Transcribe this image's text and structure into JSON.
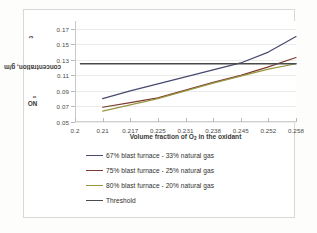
{
  "figure": {
    "background": "#ffffff",
    "border_color": "#d8d8d6"
  },
  "chart_data": {
    "type": "line",
    "title": "",
    "xlabel_text": "Volume fraction of O",
    "xlabel_sub": "2",
    "xlabel_tail": " in the oxidant",
    "ylabel_prefix": "NO",
    "ylabel_sub": "x",
    "ylabel_tail": " concentration, g/m",
    "ylabel_sup": "3",
    "categories": [
      "0.2",
      "0.21",
      "0.217",
      "0.225",
      "0.231",
      "0.238",
      "0.245",
      "0.252",
      "0.258"
    ],
    "x_positions": [
      0,
      1,
      2,
      3,
      4,
      5,
      6,
      7,
      8
    ],
    "yticks": [
      "0.05",
      "0.07",
      "0.09",
      "0.11",
      "0.13",
      "0.15",
      "0.17"
    ],
    "ytick_values": [
      0.05,
      0.07,
      0.09,
      0.11,
      0.13,
      0.15,
      0.17
    ],
    "ylim": [
      0.05,
      0.18
    ],
    "xlim": [
      0,
      8
    ],
    "grid": true,
    "legend_position": "below",
    "series": [
      {
        "name": "67% blast furnace - 33% natural gas",
        "color": "#47496e",
        "x": [
          1,
          2,
          3,
          4,
          5,
          6,
          7,
          8
        ],
        "values": [
          0.08,
          0.09,
          0.099,
          0.108,
          0.117,
          0.126,
          0.14,
          0.16
        ]
      },
      {
        "name": "75% blast furnace - 25% natural gas",
        "color": "#7b3a30",
        "x": [
          1,
          2,
          3,
          4,
          5,
          6,
          7,
          8
        ],
        "values": [
          0.069,
          0.075,
          0.081,
          0.091,
          0.101,
          0.11,
          0.121,
          0.133
        ]
      },
      {
        "name": "80% blast furnace - 20% natural gas",
        "color": "#97973f",
        "x": [
          1,
          2,
          3,
          4,
          5,
          6,
          7,
          8
        ],
        "values": [
          0.064,
          0.072,
          0.08,
          0.09,
          0.1,
          0.109,
          0.118,
          0.125
        ]
      },
      {
        "name": "Threshold",
        "color": "#4a4a4a",
        "x": [
          0.2,
          8
        ],
        "values": [
          0.125,
          0.125
        ]
      }
    ]
  },
  "legend": {
    "items": [
      {
        "label": "67% blast furnace - 33% natural gas",
        "color": "#47496e"
      },
      {
        "label": "75% blast furnace - 25% natural gas",
        "color": "#7b3a30"
      },
      {
        "label": "80% blast furnace - 20% natural gas",
        "color": "#97973f"
      },
      {
        "label": "Threshold",
        "color": "#4a4a4a"
      }
    ]
  }
}
